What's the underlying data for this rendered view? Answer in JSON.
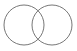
{
  "diagram": {
    "type": "venn",
    "background": "#ffffff",
    "stroke": "#777777",
    "circles": [
      {
        "name": "left",
        "cx": 24,
        "cy": 25,
        "r": 20
      },
      {
        "name": "right",
        "cx": 52,
        "cy": 25,
        "r": 20
      }
    ]
  }
}
